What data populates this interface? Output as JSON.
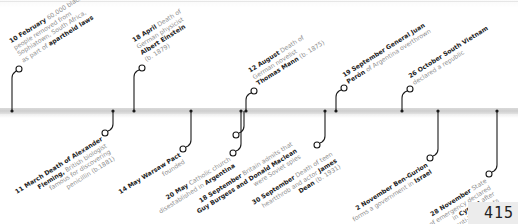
{
  "page_number": "415",
  "colors": {
    "bar": "#d4d4d4",
    "line": "#1a1a1a",
    "date_text": "#222222",
    "body_text": "#8f8f8f"
  },
  "events_above": [
    {
      "date": "10 February",
      "lines": [
        [
          {
            "t": "10 February",
            "b": true
          },
          {
            "t": " 60,000 black",
            "b": false
          }
        ],
        [
          {
            "t": "people removed from",
            "b": false
          }
        ],
        [
          {
            "t": "Sophiatown, South Africa,",
            "b": false
          }
        ],
        [
          {
            "t": "as part of ",
            "b": false
          },
          {
            "t": "apartheid laws",
            "b": true
          }
        ]
      ]
    },
    {
      "date": "18 April",
      "lines": [
        [
          {
            "t": "18 April",
            "b": true
          },
          {
            "t": " Death of",
            "b": false
          }
        ],
        [
          {
            "t": "German physicist",
            "b": false
          }
        ],
        [
          {
            "t": "Albert Einstein",
            "b": true
          }
        ],
        [
          {
            "t": "(b. 1879)",
            "b": false
          }
        ]
      ]
    },
    {
      "date": "12 August",
      "lines": [
        [
          {
            "t": "12 August",
            "b": true
          },
          {
            "t": " Death of",
            "b": false
          }
        ],
        [
          {
            "t": "German novelist",
            "b": false
          }
        ],
        [
          {
            "t": "Thomas Mann",
            "b": true
          },
          {
            "t": " (b. 1875)",
            "b": false
          }
        ]
      ]
    },
    {
      "date": "19 September",
      "lines": [
        [
          {
            "t": "19 September General Juan",
            "b": true
          }
        ],
        [
          {
            "t": "Perón",
            "b": true
          },
          {
            "t": " of Argentina overthrown",
            "b": false
          }
        ]
      ]
    },
    {
      "date": "26 October",
      "lines": [
        [
          {
            "t": "26 October South Vietnam",
            "b": true
          }
        ],
        [
          {
            "t": "declared a republic",
            "b": false
          }
        ]
      ]
    }
  ],
  "events_below": [
    {
      "date": "11 March",
      "lines": [
        [
          {
            "t": "11 March Death of Alexander",
            "b": true
          }
        ],
        [
          {
            "t": "Fleming,",
            "b": true
          },
          {
            "t": " British biologist",
            "b": false
          }
        ],
        [
          {
            "t": "famous for discovering",
            "b": false
          }
        ],
        [
          {
            "t": "penicillin (b.1881)",
            "b": false
          }
        ]
      ]
    },
    {
      "date": "14 May",
      "lines": [
        [
          {
            "t": "14 May Warsaw Pact",
            "b": true
          }
        ],
        [
          {
            "t": "founded",
            "b": false
          }
        ]
      ]
    },
    {
      "date": "20 May",
      "lines": [
        [
          {
            "t": "20 May",
            "b": true
          },
          {
            "t": " Catholic church",
            "b": false
          }
        ],
        [
          {
            "t": "disestablished in ",
            "b": false
          },
          {
            "t": "Argentina",
            "b": true
          }
        ]
      ]
    },
    {
      "date": "18 September",
      "lines": [
        [
          {
            "t": "18 September",
            "b": true
          },
          {
            "t": " Britain admits that",
            "b": false
          }
        ],
        [
          {
            "t": "Guy Burgess and Donald Maclean",
            "b": true
          }
        ],
        [
          {
            "t": "were Soviet spies",
            "b": false
          }
        ]
      ]
    },
    {
      "date": "30 September",
      "lines": [
        [
          {
            "t": "30 September",
            "b": true
          },
          {
            "t": " Death of teen",
            "b": false
          }
        ],
        [
          {
            "t": "heartthrob and actor ",
            "b": false
          },
          {
            "t": "James",
            "b": true
          }
        ],
        [
          {
            "t": "Dean",
            "b": true
          },
          {
            "t": " (b. 1931)",
            "b": false
          }
        ]
      ]
    },
    {
      "date": "2 November",
      "lines": [
        [
          {
            "t": "2 November Ben-Gurion",
            "b": true
          }
        ],
        [
          {
            "t": "forms a government in ",
            "b": false
          },
          {
            "t": "Israel",
            "b": true
          }
        ]
      ]
    },
    {
      "date": "28 November",
      "lines": [
        [
          {
            "t": "28 November",
            "b": true
          },
          {
            "t": " State",
            "b": false
          }
        ],
        [
          {
            "t": "of emergency declared",
            "b": false
          }
        ],
        [
          {
            "t": "in ",
            "b": false
          },
          {
            "t": "Cyprus",
            "b": true
          },
          {
            "t": " after",
            "b": false
          }
        ],
        [
          {
            "t": "anti-British riots",
            "b": false
          }
        ]
      ]
    }
  ]
}
